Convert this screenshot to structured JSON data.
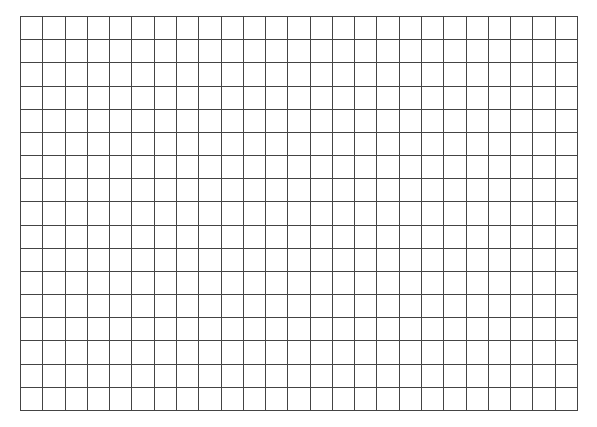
{
  "grid": {
    "columns": 25,
    "rows": 17,
    "left": 20,
    "top": 16,
    "width": 558,
    "height": 395,
    "line_color": "#444444",
    "line_width": 1,
    "background_color": "#ffffff"
  }
}
